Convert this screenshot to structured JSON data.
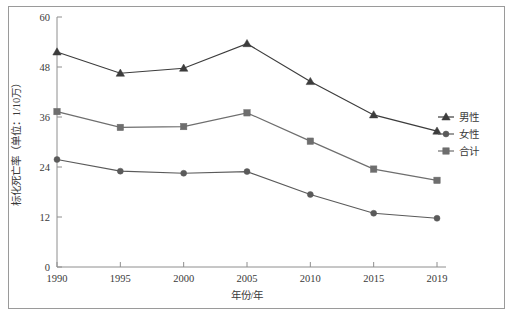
{
  "chart_data": {
    "type": "line",
    "title": "",
    "xlabel": "年份/年",
    "ylabel": "标化死亡率（单位：1/10万）",
    "categories": [
      "1990",
      "1995",
      "2000",
      "2005",
      "2010",
      "2015",
      "2019"
    ],
    "x": [
      1990,
      1995,
      2000,
      2005,
      2010,
      2015,
      2019
    ],
    "xlim": [
      1990,
      2019
    ],
    "ylim": [
      0,
      60
    ],
    "yticks": [
      0,
      12,
      24,
      36,
      48,
      60
    ],
    "xticks": [
      1990,
      1995,
      2000,
      2005,
      2010,
      2015,
      2019
    ],
    "grid": false,
    "legend_position": "right",
    "series": [
      {
        "name": "男性",
        "marker": "triangle",
        "color": "#3c3c3c",
        "values": [
          51.6,
          46.5,
          47.7,
          53.6,
          44.5,
          36.5,
          32.6
        ]
      },
      {
        "name": "合计",
        "marker": "square",
        "color": "#6e6e6e",
        "values": [
          37.3,
          33.5,
          33.7,
          37.0,
          30.2,
          23.5,
          20.8
        ]
      },
      {
        "name": "女性",
        "marker": "circle",
        "color": "#5a5a5a",
        "values": [
          25.8,
          23.0,
          22.5,
          22.9,
          17.4,
          12.9,
          11.7
        ]
      }
    ]
  },
  "legend": {
    "items": [
      {
        "label": "男性",
        "marker": "triangle"
      },
      {
        "label": "女性",
        "marker": "circle"
      },
      {
        "label": "合计",
        "marker": "square"
      }
    ]
  },
  "axes": {
    "y_title": "标化死亡率（单位：1/10万）",
    "x_title": "年份/年",
    "y_tick_labels": [
      "60",
      "48",
      "36",
      "24",
      "12",
      "0"
    ],
    "x_tick_labels": [
      "1990",
      "1995",
      "2000",
      "2005",
      "2010",
      "2015",
      "2019"
    ]
  }
}
